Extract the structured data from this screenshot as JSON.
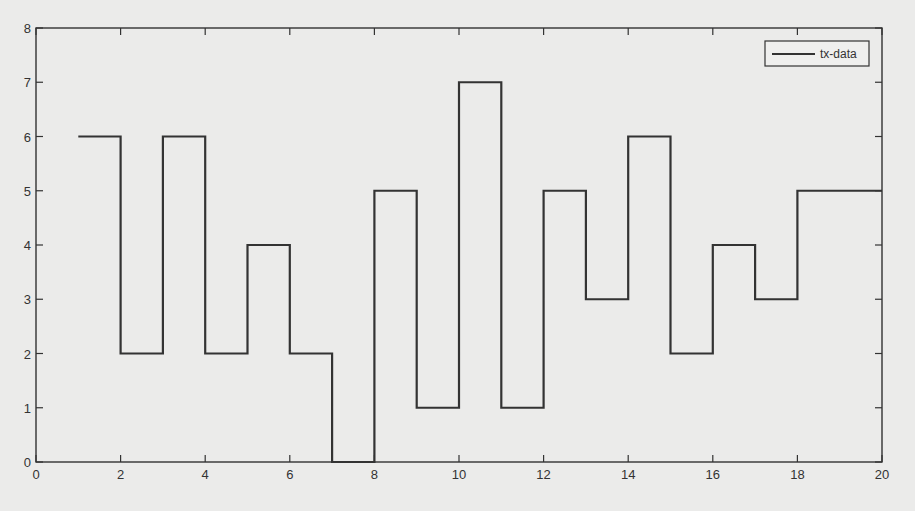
{
  "chart_data": {
    "type": "line",
    "subtype": "step",
    "title": "",
    "xlabel": "",
    "ylabel": "",
    "xlim": [
      0,
      20
    ],
    "ylim": [
      0,
      8
    ],
    "xticks": [
      0,
      2,
      4,
      6,
      8,
      10,
      12,
      14,
      16,
      18,
      20
    ],
    "yticks": [
      0,
      1,
      2,
      3,
      4,
      5,
      6,
      7,
      8
    ],
    "grid": false,
    "legend_position": "upper right",
    "series": [
      {
        "name": "tx-data",
        "color": "#333333",
        "x": [
          1,
          2,
          3,
          4,
          5,
          6,
          7,
          8,
          9,
          10,
          11,
          12,
          13,
          14,
          15,
          16,
          17,
          18,
          19,
          20
        ],
        "values": [
          6,
          2,
          6,
          2,
          4,
          2,
          0,
          5,
          1,
          7,
          1,
          5,
          3,
          6,
          2,
          4,
          3,
          5,
          5,
          5
        ]
      }
    ]
  },
  "colors": {
    "background": "#ebebea",
    "axes": "#333333",
    "line": "#333333"
  }
}
